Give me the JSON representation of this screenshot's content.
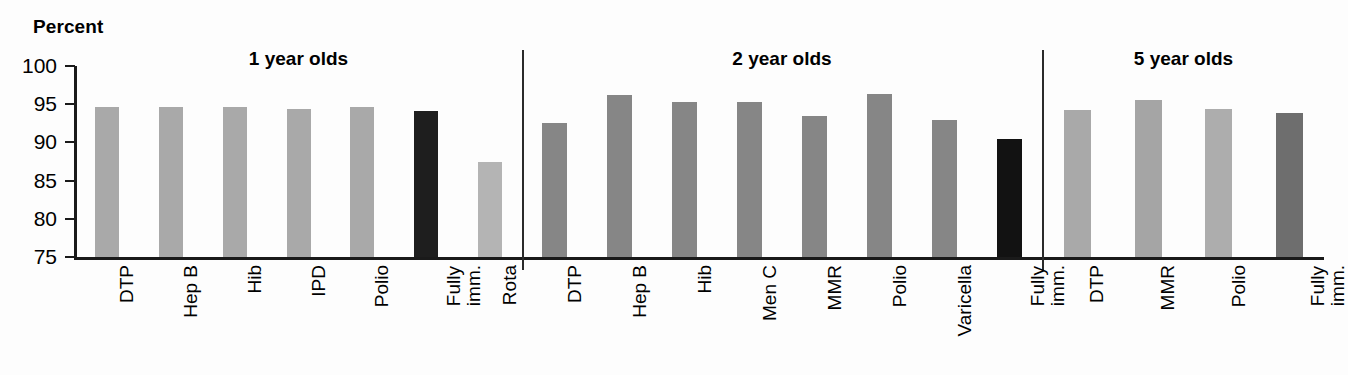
{
  "chart_data": {
    "type": "bar",
    "title": "",
    "ylabel": "Percent",
    "xlabel": "",
    "ylim": [
      75,
      100
    ],
    "yticks": [
      75,
      80,
      85,
      90,
      95,
      100
    ],
    "ytick_labels": [
      "75",
      "80",
      "85",
      "90",
      "95",
      "100"
    ],
    "grid": false,
    "legend": "none",
    "groups": [
      {
        "name": "1 year olds",
        "categories": [
          "DTP",
          "Hep B",
          "Hib",
          "IPD",
          "Polio",
          "Fully imm.",
          "Rota"
        ],
        "values": [
          94.7,
          94.7,
          94.6,
          94.4,
          94.7,
          94.1,
          87.5
        ],
        "colors": [
          "#a9a9a9",
          "#a9a9a9",
          "#a9a9a9",
          "#a9a9a9",
          "#a9a9a9",
          "#1e1e1e",
          "#b4b4b4"
        ]
      },
      {
        "name": "2 year olds",
        "categories": [
          "DTP",
          "Hep B",
          "Hib",
          "Men C",
          "MMR",
          "Polio",
          "Varicella",
          "Fully imm."
        ],
        "values": [
          92.5,
          96.2,
          95.3,
          95.3,
          93.4,
          96.4,
          92.9,
          90.4
        ],
        "colors": [
          "#868686",
          "#868686",
          "#868686",
          "#868686",
          "#868686",
          "#868686",
          "#868686",
          "#121212"
        ]
      },
      {
        "name": "5 year olds",
        "categories": [
          "DTP",
          "MMR",
          "Polio",
          "Fully imm."
        ],
        "values": [
          94.2,
          95.6,
          94.4,
          93.9
        ],
        "colors": [
          "#a9a9a9",
          "#a5a5a5",
          "#adadad",
          "#6e6e6e"
        ]
      }
    ]
  },
  "axis": {
    "percent_label": "Percent"
  },
  "layout": {
    "separator_x": [
      447,
      967
    ]
  },
  "colors": {
    "axis": "#1a1a1a",
    "background": "#fdfdfd",
    "light_gray": "#a9a9a9",
    "mid_gray": "#868686",
    "dark_gray": "#6e6e6e",
    "near_black": "#1e1e1e"
  }
}
